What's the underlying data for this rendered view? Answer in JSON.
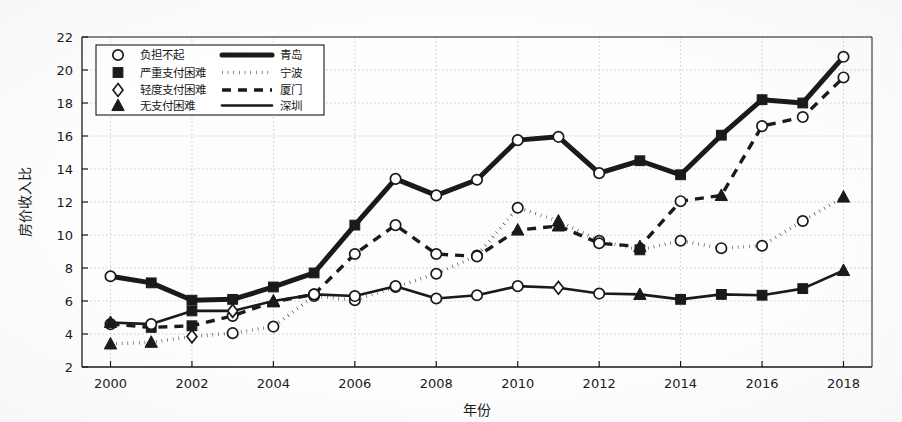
{
  "figure": {
    "background": "#fdfdfd",
    "ink": "#1a1a1a",
    "grid_color": "#bdbdbd"
  },
  "axis": {
    "x_label": "年份",
    "y_label": "房价收入比",
    "x_ticks": [
      "2000",
      "2002",
      "2004",
      "2006",
      "2008",
      "2010",
      "2012",
      "2014",
      "2016",
      "2018"
    ],
    "y_ticks": [
      "2",
      "4",
      "6",
      "8",
      "10",
      "12",
      "14",
      "16",
      "18",
      "20",
      "22"
    ]
  },
  "legend": {
    "marker_entries": [
      {
        "marker": "circle-open-marker",
        "label": "负担不起"
      },
      {
        "marker": "square-filled-marker",
        "label": "严重支付困难"
      },
      {
        "marker": "diamond-open-marker",
        "label": "轻度支付困难"
      },
      {
        "marker": "triangle-filled-marker",
        "label": "无支付困难"
      }
    ],
    "line_entries": [
      {
        "style": "solid-thick-line",
        "label": "青岛"
      },
      {
        "style": "dotted-line",
        "label": "宁波"
      },
      {
        "style": "dashed-line",
        "label": "厦门"
      },
      {
        "style": "solid-line",
        "label": "深圳"
      }
    ]
  },
  "chart_data": {
    "type": "line",
    "title": "",
    "xlabel": "年份",
    "ylabel": "房价收入比",
    "xlim": [
      1999.3,
      2018.7
    ],
    "ylim": [
      2,
      22
    ],
    "xticks": [
      2000,
      2002,
      2004,
      2006,
      2008,
      2010,
      2012,
      2014,
      2016,
      2018
    ],
    "yticks": [
      2,
      4,
      6,
      8,
      10,
      12,
      14,
      16,
      18,
      20,
      22
    ],
    "grid": true,
    "legend_position": "upper-left",
    "x": [
      2000,
      2001,
      2002,
      2003,
      2004,
      2005,
      2006,
      2007,
      2008,
      2009,
      2010,
      2011,
      2012,
      2013,
      2014,
      2015,
      2016,
      2017,
      2018
    ],
    "marker_legend": {
      "circle": "负担不起",
      "square": "严重支付困难",
      "diamond": "轻度支付困难",
      "triangle": "无支付困难"
    },
    "series": [
      {
        "name": "青岛",
        "line_style": "solid-thick",
        "values": [
          7.5,
          7.1,
          6.05,
          6.1,
          6.85,
          7.7,
          10.6,
          13.4,
          12.4,
          13.35,
          15.75,
          15.95,
          13.75,
          14.5,
          13.65,
          16.05,
          18.2,
          18.0,
          20.8
        ],
        "markers": [
          "circle",
          "square",
          "square",
          "square",
          "square",
          "square",
          "square",
          "circle",
          "circle",
          "circle",
          "circle",
          "circle",
          "circle",
          "square",
          "square",
          "square",
          "square",
          "square",
          "circle"
        ]
      },
      {
        "name": "宁波",
        "line_style": "dotted",
        "values": [
          3.4,
          3.5,
          3.85,
          4.05,
          4.45,
          6.3,
          6.05,
          6.85,
          7.65,
          8.75,
          11.65,
          10.85,
          9.65,
          9.1,
          9.65,
          9.2,
          9.35,
          10.85,
          12.3
        ],
        "markers": [
          "triangle",
          "triangle",
          "diamond",
          "circle",
          "circle",
          "circle",
          "circle",
          "circle",
          "circle",
          "circle",
          "circle",
          "triangle",
          "circle",
          "square",
          "circle",
          "circle",
          "circle",
          "circle",
          "triangle"
        ]
      },
      {
        "name": "厦门",
        "line_style": "dashed",
        "values": [
          4.6,
          4.4,
          4.5,
          5.1,
          5.95,
          6.4,
          8.85,
          10.6,
          8.85,
          8.7,
          10.3,
          10.55,
          9.5,
          9.3,
          12.05,
          12.4,
          16.6,
          17.15,
          19.55
        ],
        "markers": [
          "circle",
          "square",
          "square",
          "circle",
          "triangle",
          "circle",
          "circle",
          "circle",
          "circle",
          "circle",
          "triangle",
          "triangle",
          "circle",
          "triangle",
          "circle",
          "triangle",
          "circle",
          "circle",
          "circle"
        ]
      },
      {
        "name": "深圳",
        "line_style": "solid",
        "values": [
          4.7,
          4.6,
          5.4,
          5.4,
          6.0,
          6.4,
          6.3,
          6.9,
          6.15,
          6.35,
          6.9,
          6.8,
          6.45,
          6.4,
          6.1,
          6.4,
          6.35,
          6.75,
          7.85
        ],
        "markers": [
          "triangle",
          "circle",
          "square",
          "diamond",
          "triangle",
          "circle",
          "circle",
          "circle",
          "circle",
          "circle",
          "circle",
          "diamond",
          "circle",
          "triangle",
          "square",
          "square",
          "square",
          "square",
          "triangle"
        ]
      }
    ]
  }
}
